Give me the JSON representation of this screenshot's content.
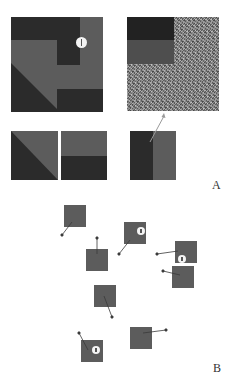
{
  "colors": {
    "dark": "#2b2b2b",
    "medium": "#5c5c5c",
    "panel_border": "#d8d8d8",
    "arrow": "#3a3a3a",
    "badge": "#f4f4f4"
  },
  "panels": {
    "A": {
      "label": "A",
      "top_left": {
        "description": "composite region map with info badge"
      },
      "top_right": {
        "description": "noise texture with dark/medium blocks in top-left corner"
      },
      "bottom_left_1": {
        "description": "diagonal split, dark lower-left"
      },
      "bottom_left_2": {
        "description": "horizontal split, dark lower half"
      },
      "bottom_right": {
        "description": "vertical split, dark left half, arrow pointing to noise panel"
      }
    },
    "B": {
      "label": "B",
      "squares": [
        {
          "id": 1,
          "x": 64,
          "y": 205,
          "badge": false,
          "arrow_to": [
            62,
            235
          ]
        },
        {
          "id": 2,
          "x": 124,
          "y": 222,
          "badge": true,
          "arrow_to": [
            119,
            254
          ]
        },
        {
          "id": 3,
          "x": 175,
          "y": 241,
          "badge": true,
          "arrow_to": [
            157,
            254
          ]
        },
        {
          "id": 4,
          "x": 86,
          "y": 249,
          "badge": false,
          "arrow_to": [
            97,
            238
          ]
        },
        {
          "id": 5,
          "x": 172,
          "y": 266,
          "badge": false,
          "arrow_to": [
            163,
            271
          ]
        },
        {
          "id": 6,
          "x": 94,
          "y": 285,
          "badge": false,
          "arrow_to": [
            112,
            317
          ]
        },
        {
          "id": 7,
          "x": 130,
          "y": 327,
          "badge": false,
          "arrow_to": [
            166,
            330
          ]
        },
        {
          "id": 8,
          "x": 81,
          "y": 340,
          "badge": true,
          "arrow_to": [
            79,
            333
          ]
        }
      ]
    }
  }
}
